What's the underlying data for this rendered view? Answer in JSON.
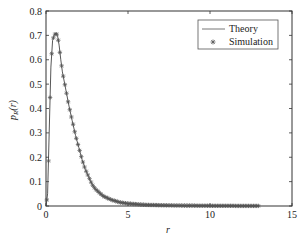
{
  "chart_data": {
    "type": "line",
    "title": "",
    "xlabel": "r",
    "ylabel": "p_R(r)",
    "xlim": [
      0,
      15
    ],
    "ylim": [
      0,
      0.8
    ],
    "xticks": [
      0,
      5,
      10,
      15
    ],
    "yticks": [
      0,
      0.1,
      0.2,
      0.3,
      0.4,
      0.5,
      0.6,
      0.7,
      0.8
    ],
    "xtick_labels": [
      "0",
      "5",
      "10",
      "15"
    ],
    "ytick_labels": [
      "0",
      "0.1",
      "0.2",
      "0.3",
      "0.4",
      "0.5",
      "0.6",
      "0.7",
      "0.8"
    ],
    "grid": false,
    "legend": {
      "position": "upper right",
      "entries": [
        "Theory",
        "Simulation"
      ]
    },
    "series": [
      {
        "name": "Theory",
        "style": "line",
        "color": "#555555",
        "x": [
          0,
          0.1,
          0.2,
          0.3,
          0.4,
          0.5,
          0.6,
          0.7,
          0.8,
          0.9,
          1.0,
          1.2,
          1.4,
          1.6,
          1.8,
          2.0,
          2.2,
          2.4,
          2.6,
          2.8,
          3.0,
          3.5,
          4.0,
          4.5,
          5.0,
          6.0,
          7.0,
          8.0,
          10.0,
          12.0,
          13.0
        ],
        "y": [
          0,
          0.05,
          0.32,
          0.57,
          0.68,
          0.7,
          0.71,
          0.7,
          0.66,
          0.6,
          0.55,
          0.48,
          0.41,
          0.35,
          0.29,
          0.24,
          0.19,
          0.15,
          0.12,
          0.09,
          0.07,
          0.04,
          0.025,
          0.015,
          0.01,
          0.005,
          0.003,
          0.002,
          0.001,
          0.0005,
          0.0003
        ]
      },
      {
        "name": "Simulation",
        "style": "markers",
        "marker": "asterisk",
        "color": "#555555",
        "x": [
          0,
          0.1,
          0.2,
          0.3,
          0.4,
          0.5,
          0.6,
          0.7,
          0.8,
          0.9,
          1.0,
          1.2,
          1.4,
          1.6,
          1.8,
          2.0,
          2.2,
          2.4,
          2.6,
          2.8,
          3.0,
          3.5,
          4.0,
          4.5,
          5.0,
          6.0,
          7.0,
          8.0,
          10.0,
          12.0,
          13.0
        ],
        "y": [
          0,
          0.05,
          0.32,
          0.57,
          0.68,
          0.7,
          0.71,
          0.7,
          0.66,
          0.6,
          0.55,
          0.48,
          0.41,
          0.35,
          0.29,
          0.24,
          0.19,
          0.15,
          0.12,
          0.09,
          0.07,
          0.04,
          0.025,
          0.015,
          0.01,
          0.005,
          0.003,
          0.002,
          0.001,
          0.0005,
          0.0003
        ]
      }
    ]
  },
  "labels": {
    "xlabel": "r",
    "ylabel_main": "p",
    "ylabel_sub": "R",
    "ylabel_arg": "(r)",
    "legend_theory": "Theory",
    "legend_simulation": "Simulation"
  }
}
